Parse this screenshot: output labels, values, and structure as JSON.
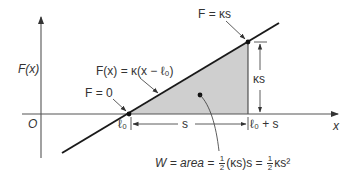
{
  "diagram": {
    "axes": {
      "y_label": "F(x)",
      "x_label": "x",
      "origin_label": "O"
    },
    "line_label": "F(x) = κ(x − ℓ₀)",
    "points": {
      "zero_force_label": "F = 0",
      "end_force_label": "F = κs"
    },
    "dimensions": {
      "vertical_label": "κs",
      "horizontal_label": "s",
      "start_tick_label": "ℓ₀",
      "end_tick_label": "ℓ₀ + s"
    },
    "area_equation": {
      "lhs": "W = area = ",
      "half": {
        "num": "1",
        "den": "2"
      },
      "middle": "(κs)s = ",
      "tail": "κs²"
    },
    "colors": {
      "line": "#1a1a1a",
      "axis": "#555555",
      "fill": "#cfcfcf",
      "text": "#333333"
    }
  }
}
